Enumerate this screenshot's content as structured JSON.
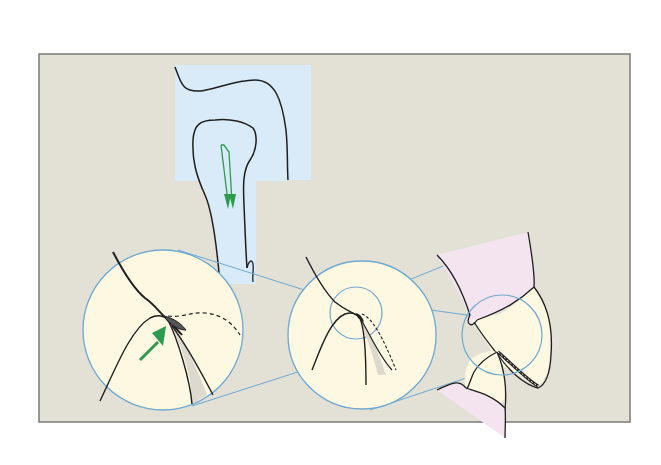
{
  "figure": {
    "type": "anatomical-illustration",
    "panels": [
      {
        "id": "sagittal-overview",
        "description": "blue-shaded cross section with green double arrow pointing downward"
      },
      {
        "id": "magnified-contact-large",
        "description": "large circle with dashed contour and green arrow pointing at hatched contact region"
      },
      {
        "id": "magnified-contact-medium",
        "description": "medium circle with inner focus ring and dashed contour"
      },
      {
        "id": "tooth-pair-overview",
        "description": "two teeth with pink crown areas and small focus circle at contact point"
      }
    ],
    "colors": {
      "background": "#ffffff",
      "panel": "#e3e0d6",
      "panel_border": "#7a7a78",
      "blue_fill": "#d9ebf8",
      "lens_fill": "#fdf8e2",
      "lens_stroke": "#6fa8d0",
      "line": "#1f1f1f",
      "arrow_green": "#2e9a4e",
      "pink": "#f3e4ef"
    }
  }
}
